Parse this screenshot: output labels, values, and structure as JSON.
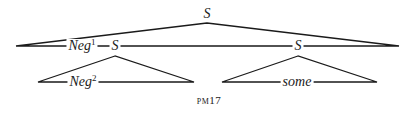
{
  "diagram": {
    "type": "phrase-marker-tree",
    "caption": "pm17",
    "line_color": "#1a1a1a",
    "nodes": {
      "root": {
        "label": "S",
        "x": 207,
        "y": 14
      },
      "neg1": {
        "label": "Neg",
        "sup": "1",
        "x": 82,
        "y": 46
      },
      "s_left": {
        "label": "S",
        "x": 115,
        "y": 46
      },
      "s_right": {
        "label": "S",
        "x": 298,
        "y": 46
      },
      "neg2": {
        "label": "Neg",
        "sup": "2",
        "x": 83,
        "y": 82
      },
      "some": {
        "label": "some",
        "x": 297,
        "y": 82
      }
    },
    "triangles": [
      {
        "name": "root-triangle",
        "apex": [
          207,
          23
        ],
        "left": [
          16,
          46
        ],
        "right": [
          399,
          46
        ]
      },
      {
        "name": "left-subtree-triangle",
        "apex": [
          115,
          56
        ],
        "left": [
          38,
          82
        ],
        "right": [
          194,
          82
        ]
      },
      {
        "name": "right-subtree-triangle",
        "apex": [
          298,
          56
        ],
        "left": [
          222,
          82
        ],
        "right": [
          377,
          82
        ]
      }
    ]
  }
}
